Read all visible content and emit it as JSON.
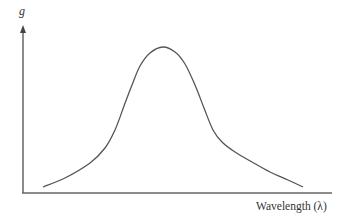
{
  "chart_data": {
    "type": "line",
    "title": "",
    "xlabel": "Wavelength (λ)",
    "ylabel": "g",
    "grid": false,
    "legend": null,
    "x_ticks": [],
    "y_ticks": [],
    "series": [
      {
        "name": "g",
        "points_px": [
          [
            43,
            187
          ],
          [
            65,
            178
          ],
          [
            90,
            163
          ],
          [
            105,
            148
          ],
          [
            115,
            130
          ],
          [
            124,
            106
          ],
          [
            132,
            85
          ],
          [
            140,
            66
          ],
          [
            150,
            53
          ],
          [
            163,
            47
          ],
          [
            175,
            52
          ],
          [
            185,
            64
          ],
          [
            195,
            85
          ],
          [
            204,
            108
          ],
          [
            213,
            130
          ],
          [
            222,
            142
          ],
          [
            235,
            152
          ],
          [
            252,
            162
          ],
          [
            270,
            172
          ],
          [
            288,
            180
          ],
          [
            303,
            187
          ]
        ]
      }
    ],
    "colors": {
      "curve": "#555555",
      "axis": "#666666"
    }
  },
  "labels": {
    "y_axis": "g",
    "x_axis": "Wavelength (λ)"
  }
}
